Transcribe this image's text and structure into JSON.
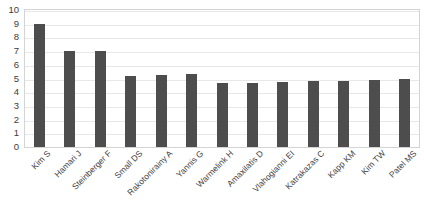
{
  "chart_data": {
    "type": "bar",
    "title": "",
    "subtitle": "",
    "xlabel": "",
    "ylabel": "",
    "categories": [
      "Kim S",
      "Hamari J",
      "Steinberger F",
      "Small DS",
      "Rakotonirainy A",
      "Yannis G",
      "Warmelink H",
      "Amaxilatis D",
      "Vlahogianni EI",
      "Katrakazas C",
      "Kapp KM",
      "Kim TW",
      "Patel MS"
    ],
    "values": [
      9,
      7,
      7,
      5.2,
      5.25,
      5.3,
      4.65,
      4.7,
      4.75,
      4.8,
      4.85,
      4.9,
      4.95
    ],
    "ylim": [
      0,
      10
    ],
    "ytick_step": 1,
    "yticks": [
      "10",
      "9",
      "8",
      "7",
      "6",
      "5",
      "4",
      "3",
      "2",
      "1",
      "0"
    ],
    "grid": true,
    "grid_axis": "y",
    "legend": false,
    "legend_position": "none",
    "bar_color": "#4d4d4d",
    "grid_color": "#e8e8e8",
    "border_color": "#d4d4d4",
    "background_color": "#ffffff",
    "label_rotation_degrees": -45
  }
}
